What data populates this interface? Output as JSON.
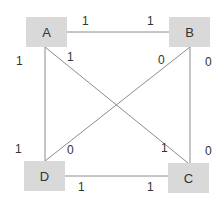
{
  "diagram": {
    "nodes": [
      {
        "id": "A",
        "label": "A",
        "x": 26,
        "y": 17
      },
      {
        "id": "B",
        "label": "B",
        "x": 169,
        "y": 17
      },
      {
        "id": "D",
        "label": "D",
        "x": 24,
        "y": 161
      },
      {
        "id": "C",
        "label": "C",
        "x": 168,
        "y": 163
      }
    ],
    "edges": [
      {
        "from": "A",
        "to": "B",
        "labels": [
          "1",
          "1"
        ]
      },
      {
        "from": "A",
        "to": "D",
        "labels": [
          "1",
          "1"
        ]
      },
      {
        "from": "A",
        "to": "C",
        "labels": [
          "1",
          "1"
        ]
      },
      {
        "from": "B",
        "to": "D",
        "labels": [
          "0",
          "0"
        ]
      },
      {
        "from": "B",
        "to": "C",
        "labels": [
          "0",
          "0"
        ]
      },
      {
        "from": "D",
        "to": "C",
        "labels": [
          "1",
          "1"
        ]
      }
    ],
    "edge_labels": [
      {
        "text": "1",
        "x": 82,
        "y": 15
      },
      {
        "text": "1",
        "x": 147,
        "y": 15
      },
      {
        "text": "1",
        "x": 16,
        "y": 55
      },
      {
        "text": "1",
        "x": 67,
        "y": 51
      },
      {
        "text": "0",
        "x": 158,
        "y": 54
      },
      {
        "text": "0",
        "x": 205,
        "y": 56
      },
      {
        "text": "1",
        "x": 15,
        "y": 143
      },
      {
        "text": "0",
        "x": 67,
        "y": 144
      },
      {
        "text": "1",
        "x": 161,
        "y": 142
      },
      {
        "text": "0",
        "x": 205,
        "y": 145
      },
      {
        "text": "1",
        "x": 78,
        "y": 181
      },
      {
        "text": "1",
        "x": 147,
        "y": 181
      }
    ],
    "line_color": "#8c8c8c",
    "node_fill": "#d9d9d9"
  }
}
